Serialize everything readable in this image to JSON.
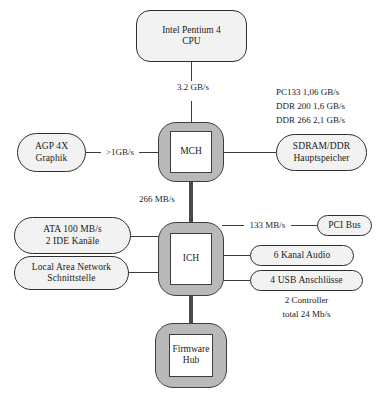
{
  "diagram": {
    "colors": {
      "chip_fill": "#b9b9b9",
      "node_fill": "#f2f2f2",
      "line": "#3a3a3a",
      "text": "#1a1a1a",
      "background": "#ffffff"
    },
    "nodes": {
      "cpu": {
        "line1": "Intel Pentium 4",
        "line2": "CPU"
      },
      "mch": {
        "label": "MCH"
      },
      "ich": {
        "label": "ICH"
      },
      "firmware_hub": {
        "line1": "Firmware",
        "line2": "Hub"
      },
      "agp": {
        "line1": "AGP 4X",
        "line2": "Graphik"
      },
      "memory": {
        "line1": "SDRAM/DDR",
        "line2": "Hauptspeicher"
      },
      "ata": {
        "line1": "ATA 100 MB/s",
        "line2": "2 IDE Kanäle"
      },
      "lan": {
        "line1": "Local Area Network",
        "line2": "Schnittstelle"
      },
      "pci": {
        "label": "PCI Bus"
      },
      "audio": {
        "label": "6 Kanal Audio"
      },
      "usb": {
        "label": "4 USB Anschlüsse"
      }
    },
    "link_labels": {
      "cpu_mch": "3.2 GB/s",
      "agp_mch": ">1GB/s",
      "mch_ich": "266 MB/s",
      "ich_pci": "133 MB/s"
    },
    "memory_speeds": {
      "line1": "PC133 1,06 GB/s",
      "line2": "DDR 200 1,6 GB/s",
      "line3": "DDR 266 2,1 GB/s"
    },
    "usb_notes": {
      "line1": "2 Controller",
      "line2": "total 24 Mb/s"
    }
  }
}
